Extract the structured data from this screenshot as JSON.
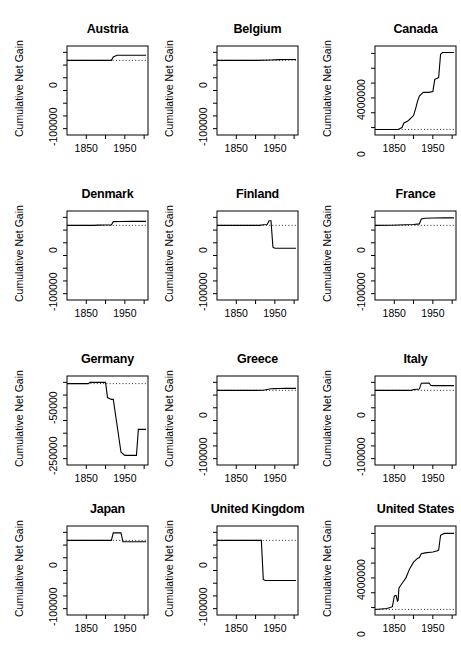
{
  "figure": {
    "type": "small-multiples-line-grid",
    "rows": 4,
    "cols": 3,
    "shared_ylabel": "Cumulative Net Gain",
    "xtick_labels_shown": [
      "1850",
      "1950"
    ],
    "xticks_all": [
      1850,
      1900,
      1950,
      2000
    ],
    "x_range": [
      1800,
      2010
    ],
    "zero_reference_line": "dotted"
  },
  "chart_data": [
    {
      "type": "line",
      "title": "Austria",
      "xlabel": "",
      "ylabel": "Cumulative Net Gain",
      "ylim": [
        -130000,
        25000
      ],
      "ytick_values": [
        0,
        -100000
      ],
      "ytick_labels": [
        "0",
        "-100000"
      ],
      "yticks_minor_count": 7,
      "xlim": [
        1800,
        2010
      ],
      "xticks": [
        1850,
        1900,
        1950,
        2000
      ],
      "xtick_labels": [
        "1850",
        "",
        "1950",
        ""
      ],
      "grid": false,
      "x": [
        1800,
        1870,
        1900,
        1910,
        1915,
        1920,
        1930,
        1950,
        1980,
        2005
      ],
      "y": [
        0,
        0,
        0,
        0,
        0,
        6000,
        9000,
        9000,
        9000,
        9000
      ]
    },
    {
      "type": "line",
      "title": "Belgium",
      "xlabel": "",
      "ylabel": "Cumulative Net Gain",
      "ylim": [
        -130000,
        25000
      ],
      "ytick_values": [
        0,
        -100000
      ],
      "ytick_labels": [
        "0",
        "-100000"
      ],
      "yticks_minor_count": 7,
      "xlim": [
        1800,
        2010
      ],
      "xticks": [
        1850,
        1900,
        1950,
        2000
      ],
      "xtick_labels": [
        "1850",
        "",
        "1950",
        ""
      ],
      "grid": false,
      "x": [
        1800,
        1850,
        1900,
        1940,
        1960,
        1980,
        2005
      ],
      "y": [
        0,
        0,
        0,
        600,
        1200,
        1400,
        1500
      ]
    },
    {
      "type": "line",
      "title": "Canada",
      "xlabel": "",
      "ylabel": "Cumulative Net Gain",
      "ylim": [
        -600000,
        9000000
      ],
      "ytick_values": [
        0,
        4000000
      ],
      "ytick_labels": [
        "0",
        "4000000"
      ],
      "yticks_minor_count": 6,
      "xlim": [
        1800,
        2010
      ],
      "xticks": [
        1850,
        1900,
        1950,
        2000
      ],
      "xtick_labels": [
        "1850",
        "",
        "1950",
        ""
      ],
      "grid": false,
      "x": [
        1800,
        1860,
        1870,
        1875,
        1885,
        1890,
        1900,
        1905,
        1910,
        1915,
        1925,
        1930,
        1940,
        1950,
        1955,
        1960,
        1965,
        1970,
        1975,
        2005
      ],
      "y": [
        0,
        0,
        200000,
        700000,
        900000,
        1100000,
        1500000,
        2200000,
        3000000,
        3600000,
        4000000,
        4000000,
        4000000,
        4100000,
        5400000,
        5500000,
        5600000,
        8100000,
        8300000,
        8300000
      ]
    },
    {
      "type": "line",
      "title": "Denmark",
      "xlabel": "",
      "ylabel": "Cumulative Net Gain",
      "ylim": [
        -130000,
        25000
      ],
      "ytick_values": [
        0,
        -100000
      ],
      "ytick_labels": [
        "0",
        "-100000"
      ],
      "yticks_minor_count": 7,
      "xlim": [
        1800,
        2010
      ],
      "xticks": [
        1850,
        1900,
        1950,
        2000
      ],
      "xtick_labels": [
        "1850",
        "",
        "1950",
        ""
      ],
      "grid": false,
      "x": [
        1800,
        1870,
        1880,
        1900,
        1915,
        1920,
        1940,
        1970,
        2005
      ],
      "y": [
        0,
        0,
        400,
        500,
        700,
        6500,
        6800,
        7000,
        7000
      ]
    },
    {
      "type": "line",
      "title": "Finland",
      "xlabel": "",
      "ylabel": "Cumulative Net Gain",
      "ylim": [
        -130000,
        25000
      ],
      "ytick_values": [
        0,
        -100000
      ],
      "ytick_labels": [
        "0",
        "-100000"
      ],
      "yticks_minor_count": 7,
      "xlim": [
        1800,
        2010
      ],
      "xticks": [
        1850,
        1900,
        1950,
        2000
      ],
      "xtick_labels": [
        "1850",
        "",
        "1950",
        ""
      ],
      "grid": false,
      "x": [
        1800,
        1890,
        1900,
        1910,
        1920,
        1930,
        1935,
        1940,
        1945,
        1950,
        1960,
        2005
      ],
      "y": [
        0,
        0,
        0,
        0,
        1000,
        1500,
        8000,
        8000,
        -38000,
        -40000,
        -40000,
        -40000
      ]
    },
    {
      "type": "line",
      "title": "France",
      "xlabel": "",
      "ylabel": "Cumulative Net Gain",
      "ylim": [
        -130000,
        25000
      ],
      "ytick_values": [
        0,
        -100000
      ],
      "ytick_labels": [
        "0",
        "-100000"
      ],
      "yticks_minor_count": 7,
      "xlim": [
        1800,
        2010
      ],
      "xticks": [
        1850,
        1900,
        1950,
        2000
      ],
      "xtick_labels": [
        "1850",
        "",
        "1950",
        ""
      ],
      "grid": false,
      "x": [
        1800,
        1840,
        1860,
        1880,
        1900,
        1910,
        1915,
        1920,
        1930,
        1950,
        1980,
        2005
      ],
      "y": [
        0,
        200,
        600,
        1000,
        1600,
        2200,
        2500,
        11000,
        12500,
        12800,
        13000,
        13000
      ]
    },
    {
      "type": "line",
      "title": "Germany",
      "xlabel": "",
      "ylabel": "Cumulative Net Gain",
      "ylim": [
        -320000,
        30000
      ],
      "ytick_values": [
        -50000,
        -250000
      ],
      "ytick_labels": [
        "-50000",
        "-250000"
      ],
      "yticks_minor_count": 7,
      "xlim": [
        1800,
        2010
      ],
      "xticks": [
        1850,
        1900,
        1950,
        2000
      ],
      "xtick_labels": [
        "1850",
        "",
        "1950",
        ""
      ],
      "grid": false,
      "x": [
        1800,
        1850,
        1855,
        1860,
        1865,
        1890,
        1900,
        1905,
        1915,
        1920,
        1940,
        1950,
        1955,
        1960,
        1975,
        1980,
        1985,
        2005
      ],
      "y": [
        0,
        0,
        0,
        5000,
        5000,
        5000,
        5000,
        -55000,
        -62000,
        -62000,
        -270000,
        -282000,
        -282000,
        -282000,
        -282000,
        -282000,
        -180000,
        -180000
      ]
    },
    {
      "type": "line",
      "title": "Greece",
      "xlabel": "",
      "ylabel": "Cumulative Net Gain",
      "ylim": [
        -130000,
        25000
      ],
      "ytick_values": [
        0,
        -100000
      ],
      "ytick_labels": [
        "0",
        "-100000"
      ],
      "yticks_minor_count": 7,
      "xlim": [
        1800,
        2010
      ],
      "xticks": [
        1850,
        1900,
        1950,
        2000
      ],
      "xtick_labels": [
        "1850",
        "",
        "1950",
        ""
      ],
      "grid": false,
      "x": [
        1800,
        1900,
        1920,
        1930,
        1940,
        1950,
        1960,
        1980,
        2005
      ],
      "y": [
        0,
        0,
        300,
        1500,
        2800,
        3000,
        3200,
        3400,
        3500
      ]
    },
    {
      "type": "line",
      "title": "Italy",
      "xlabel": "",
      "ylabel": "Cumulative Net Gain",
      "ylim": [
        -130000,
        25000
      ],
      "ytick_values": [
        0,
        -100000
      ],
      "ytick_labels": [
        "0",
        "-100000"
      ],
      "yticks_minor_count": 7,
      "xlim": [
        1800,
        2010
      ],
      "xticks": [
        1850,
        1900,
        1950,
        2000
      ],
      "xtick_labels": [
        "1850",
        "",
        "1950",
        ""
      ],
      "grid": false,
      "x": [
        1800,
        1895,
        1900,
        1910,
        1915,
        1920,
        1940,
        1945,
        1950,
        1970,
        2005
      ],
      "y": [
        0,
        0,
        1500,
        2000,
        2200,
        12500,
        12800,
        8500,
        8200,
        8200,
        8200
      ]
    },
    {
      "type": "line",
      "title": "Japan",
      "xlabel": "",
      "ylabel": "Cumulative Net Gain",
      "ylim": [
        -130000,
        25000
      ],
      "ytick_values": [
        0,
        -100000
      ],
      "ytick_labels": [
        "0",
        "-100000"
      ],
      "yticks_minor_count": 7,
      "xlim": [
        1800,
        2010
      ],
      "xticks": [
        1850,
        1900,
        1950,
        2000
      ],
      "xtick_labels": [
        "1850",
        "",
        "1950",
        ""
      ],
      "grid": false,
      "x": [
        1800,
        1900,
        1910,
        1915,
        1920,
        1940,
        1945,
        1950,
        1970,
        2005
      ],
      "y": [
        0,
        0,
        0,
        0,
        13000,
        13200,
        -2500,
        -2500,
        -2500,
        -2500
      ]
    },
    {
      "type": "line",
      "title": "United Kingdom",
      "xlabel": "",
      "ylabel": "Cumulative Net Gain",
      "ylim": [
        -130000,
        25000
      ],
      "ytick_values": [
        0,
        -100000
      ],
      "ytick_labels": [
        "0",
        "-100000"
      ],
      "yticks_minor_count": 7,
      "xlim": [
        1800,
        2010
      ],
      "xticks": [
        1850,
        1900,
        1950,
        2000
      ],
      "xtick_labels": [
        "1850",
        "",
        "1950",
        ""
      ],
      "grid": false,
      "x": [
        1800,
        1850,
        1900,
        1915,
        1920,
        1925,
        1950,
        1980,
        2005
      ],
      "y": [
        0,
        0,
        0,
        0,
        -68000,
        -70000,
        -70000,
        -70000,
        -70000
      ]
    },
    {
      "type": "line",
      "title": "United States",
      "xlabel": "",
      "ylabel": "Cumulative Net Gain",
      "ylim": [
        -600000,
        9000000
      ],
      "ytick_values": [
        0,
        4000000
      ],
      "ytick_labels": [
        "0",
        "4000000"
      ],
      "yticks_minor_count": 6,
      "xlim": [
        1800,
        2010
      ],
      "xticks": [
        1850,
        1900,
        1950,
        2000
      ],
      "xtick_labels": [
        "1850",
        "",
        "1950",
        ""
      ],
      "grid": false,
      "x": [
        1800,
        1830,
        1840,
        1845,
        1850,
        1852,
        1855,
        1858,
        1860,
        1862,
        1865,
        1870,
        1875,
        1880,
        1885,
        1890,
        1900,
        1910,
        1915,
        1920,
        1930,
        1950,
        1960,
        1965,
        1970,
        1975,
        1980,
        2005
      ],
      "y": [
        0,
        100000,
        200000,
        300000,
        1400000,
        1500000,
        1500000,
        900000,
        1000000,
        2300000,
        2500000,
        2800000,
        3100000,
        3400000,
        3900000,
        4400000,
        5100000,
        5500000,
        5600000,
        6000000,
        6100000,
        6200000,
        6300000,
        6400000,
        8000000,
        8100000,
        8200000,
        8200000
      ]
    }
  ]
}
